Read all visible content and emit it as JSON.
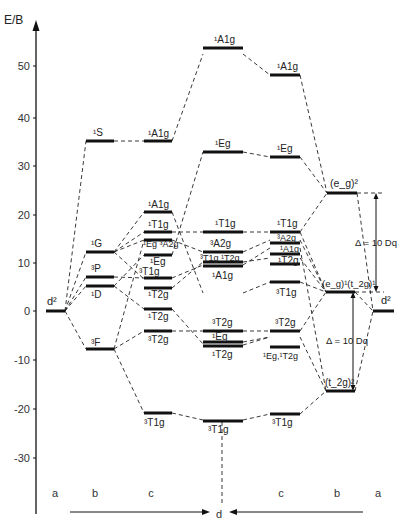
{
  "axis": {
    "title": "E/B",
    "ticks": [
      {
        "label": "50",
        "y": 66
      },
      {
        "label": "40",
        "y": 118
      },
      {
        "label": "30",
        "y": 166
      },
      {
        "label": "20",
        "y": 215
      },
      {
        "label": "10",
        "y": 263
      },
      {
        "label": "0",
        "y": 311
      },
      {
        "label": "-10",
        "y": 360
      },
      {
        "label": "-20",
        "y": 409
      },
      {
        "label": "-30",
        "y": 458
      }
    ]
  },
  "columns": {
    "left_a": "a",
    "left_b": "b",
    "left_c": "c",
    "center_d": "d",
    "right_c": "c",
    "right_b": "b",
    "right_a": "a"
  },
  "configurations": {
    "d2_left": "d²",
    "d2_right": "d²",
    "eg2": "(e_g)²",
    "eg1t2g1": "(e_g)¹(t_2g)¹",
    "t2g2": "(t_2g)²"
  },
  "free_ion_terms": [
    {
      "term": "¹S",
      "energy": 42.5
    },
    {
      "term": "¹G",
      "energy": 12.2
    },
    {
      "term": "³P",
      "energy": 7.0
    },
    {
      "term": "¹D",
      "energy": 5.0
    },
    {
      "term": "³F",
      "energy": -7.8
    }
  ],
  "splitting_labels": {
    "upper": "Δ = 10 Dq",
    "lower": "Δ = 10 Dq"
  },
  "labels": {
    "c_left": [
      "¹A1g",
      "¹A1g",
      "¹T1g",
      "¹Eg ³A2g",
      "¹Eg",
      "³T1g",
      "¹T2g",
      "¹T2g",
      "³T2g",
      "³T1g"
    ],
    "d_center": [
      "¹A1g",
      "¹Eg",
      "¹T1g",
      "³A2g",
      "³T1g ¹T2g",
      "¹A1g",
      "³T2g",
      "¹Eg",
      "¹T2g",
      "³T1g"
    ],
    "c_right": [
      "¹A1g",
      "¹Eg",
      "¹T1g",
      "³A2g",
      "¹A1g",
      "¹T2g",
      "³T1g",
      "³T2g",
      "¹Eg,¹T2g",
      "³T1g"
    ]
  }
}
